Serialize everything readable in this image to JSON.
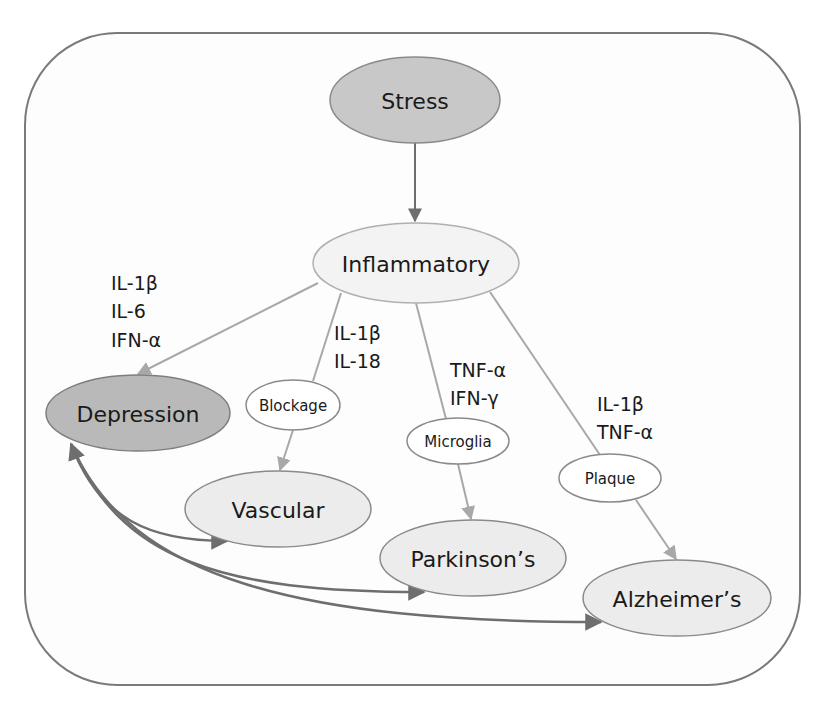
{
  "diagram": {
    "title": "",
    "colors": {
      "frame_stroke": "#7a7a7a",
      "dark_node_fill": "#c4c4c4",
      "darker_node_fill": "#b8b8b8",
      "light_node_fill": "#f2f2f2",
      "white_node_fill": "#ffffff",
      "node_stroke": "#8a8a8a",
      "arrow_dark": "#6e6e6e",
      "arrow_light": "#a8a8a8"
    },
    "nodes": {
      "stress": {
        "label": "Stress"
      },
      "inflammatory": {
        "label": "Inflammatory"
      },
      "depression": {
        "label": "Depression"
      },
      "blockage": {
        "label": "Blockage"
      },
      "microglia": {
        "label": "Microglia"
      },
      "plaque": {
        "label": "Plaque"
      },
      "vascular": {
        "label": "Vascular"
      },
      "parkinsons": {
        "label": "Parkinson’s"
      },
      "alzheimers": {
        "label": "Alzheimer’s"
      }
    },
    "cytokine_labels": {
      "depression": [
        "IL-1β",
        "IL-6",
        "IFN-α"
      ],
      "vascular": [
        "IL-1β",
        "IL-18"
      ],
      "parkinsons": [
        "TNF-α",
        "IFN-γ"
      ],
      "alzheimers": [
        "IL-1β",
        "TNF-α"
      ]
    },
    "edges": [
      {
        "from": "Stress",
        "to": "Inflammatory",
        "style": "dark"
      },
      {
        "from": "Inflammatory",
        "to": "Depression",
        "style": "light"
      },
      {
        "from": "Inflammatory",
        "to": "Blockage",
        "style": "light"
      },
      {
        "from": "Blockage",
        "to": "Vascular",
        "style": "light"
      },
      {
        "from": "Inflammatory",
        "to": "Microglia",
        "style": "light"
      },
      {
        "from": "Microglia",
        "to": "Parkinson’s",
        "style": "light"
      },
      {
        "from": "Inflammatory",
        "to": "Plaque",
        "style": "light"
      },
      {
        "from": "Plaque",
        "to": "Alzheimer’s",
        "style": "light"
      },
      {
        "from": "Depression",
        "to": "Vascular",
        "style": "dark-bidirectional"
      },
      {
        "from": "Depression",
        "to": "Parkinson’s",
        "style": "dark-bidirectional"
      },
      {
        "from": "Depression",
        "to": "Alzheimer’s",
        "style": "dark-bidirectional"
      }
    ]
  }
}
